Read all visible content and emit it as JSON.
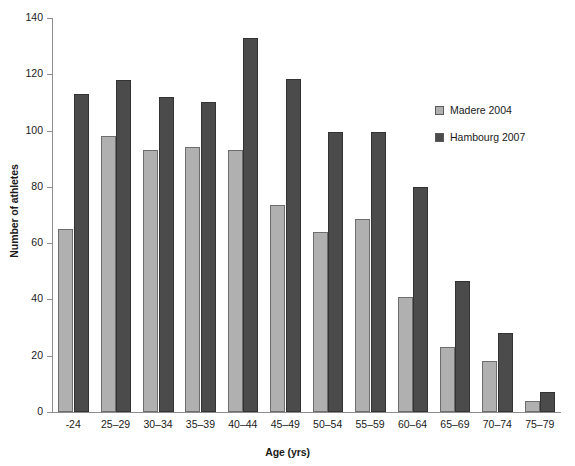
{
  "chart_data": {
    "type": "bar",
    "title": "",
    "xlabel": "Age (yrs)",
    "ylabel": "Number of athletes",
    "categories": [
      "-24",
      "25–29",
      "30–34",
      "35–39",
      "40–44",
      "45–49",
      "50–54",
      "55–59",
      "60–64",
      "65–69",
      "70–74",
      "75–79"
    ],
    "series": [
      {
        "name": "Madere 2004",
        "color": "#b0b0b0",
        "values": [
          65,
          98,
          93,
          94,
          93,
          73.5,
          64,
          68.5,
          41,
          23,
          18,
          4
        ]
      },
      {
        "name": "Hambourg 2007",
        "color": "#4b4b4b",
        "values": [
          113,
          118,
          112,
          110,
          133,
          118.5,
          99.5,
          99.5,
          80,
          46.5,
          28,
          7
        ]
      }
    ],
    "ylim": [
      0,
      140
    ],
    "yticks": [
      0,
      20,
      40,
      60,
      80,
      100,
      120,
      140
    ],
    "ytick_labels": [
      "0",
      "20",
      "40",
      "60",
      "80",
      "100",
      "120",
      "140"
    ],
    "grid": false,
    "legend_position": "upper right"
  },
  "legend": {
    "entries": [
      {
        "label": "Madere 2004",
        "color": "#b0b0b0"
      },
      {
        "label": "Hambourg 2007",
        "color": "#4b4b4b"
      }
    ]
  },
  "axes": {
    "x_title": "Age (yrs)",
    "y_title": "Number of athletes"
  }
}
